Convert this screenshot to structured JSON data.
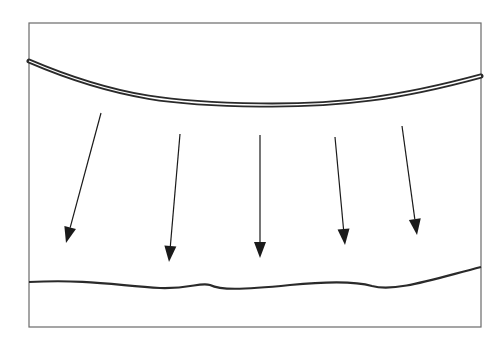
{
  "diagram": {
    "frame": {
      "x": 29,
      "y": 23,
      "width": 452,
      "height": 304,
      "stroke": "#6a6a6a"
    },
    "top_curve": {
      "path": "M29,61 C120,100 180,104 260,105 C340,106 400,98 481,76",
      "stroke": "#2a2a2a",
      "style": "double-line"
    },
    "bottom_curve": {
      "path": "M29,282 C90,279 120,286 160,288 C190,289 200,282 210,285 C220,290 240,290 290,285 C330,281 355,281 372,286 C395,292 430,280 481,267",
      "stroke": "#2a2a2a"
    },
    "arrows": [
      {
        "x1": 101,
        "y1": 113,
        "x2": 66,
        "y2": 243
      },
      {
        "x1": 180,
        "y1": 134,
        "x2": 169,
        "y2": 262
      },
      {
        "x1": 260,
        "y1": 135,
        "x2": 260,
        "y2": 258
      },
      {
        "x1": 335,
        "y1": 137,
        "x2": 345,
        "y2": 245
      },
      {
        "x1": 402,
        "y1": 126,
        "x2": 417,
        "y2": 235
      }
    ],
    "arrow_color": "#1a1a1a"
  }
}
